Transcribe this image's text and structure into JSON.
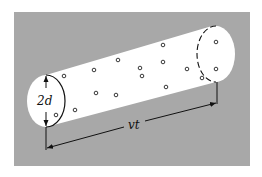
{
  "diagram": {
    "type": "collision-cylinder",
    "colors": {
      "page": "#ffffff",
      "panel": "#a8a8a8",
      "cylinder": "#ffffff",
      "ink": "#111111"
    },
    "labels": {
      "diameter": "2d",
      "length": "vt"
    },
    "panel": {
      "x": 14,
      "y": 12,
      "w": 236,
      "h": 154
    },
    "left_face": {
      "cx": 46,
      "cy": 101,
      "rx": 19,
      "ry": 26
    },
    "right_face": {
      "cx": 216,
      "cy": 54,
      "rx": 19,
      "ry": 28
    },
    "molecules": [
      {
        "x": 64,
        "y": 76
      },
      {
        "x": 94,
        "y": 70
      },
      {
        "x": 118,
        "y": 60
      },
      {
        "x": 140,
        "y": 68
      },
      {
        "x": 142,
        "y": 76
      },
      {
        "x": 163,
        "y": 45
      },
      {
        "x": 163,
        "y": 62
      },
      {
        "x": 187,
        "y": 69
      },
      {
        "x": 202,
        "y": 78
      },
      {
        "x": 166,
        "y": 87
      },
      {
        "x": 96,
        "y": 93
      },
      {
        "x": 116,
        "y": 95
      },
      {
        "x": 75,
        "y": 110
      },
      {
        "x": 56,
        "y": 115
      },
      {
        "x": 216,
        "y": 42
      },
      {
        "x": 216,
        "y": 69
      }
    ]
  }
}
